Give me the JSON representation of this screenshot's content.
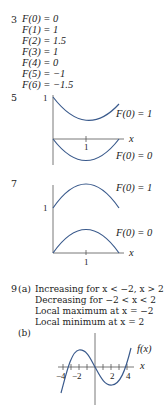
{
  "problem3": {
    "number": "3",
    "values": [
      "F(0) = 0",
      "F(1) = 1",
      "F(2) = 1.5",
      "F(3) = 1",
      "F(4) = 0",
      "F(5) = −1",
      "F(6) = −1.5"
    ]
  },
  "problem5": {
    "number": "5",
    "y_tick": "1",
    "x_tick": "1",
    "x_label": "x",
    "curve_labels": [
      "F(0) = 1",
      "F(0) = 0"
    ]
  },
  "problem7": {
    "number": "7",
    "y_tick": "1",
    "x_tick": "1",
    "x_label": "x",
    "curve_labels": [
      "F(0) = 1",
      "F(0) = 0"
    ]
  },
  "problem9": {
    "number": "9",
    "part_a": {
      "label": "(a)",
      "lines": [
        "Increasing for x < −2, x > 2",
        "Decreasing for −2 < x < 2",
        "Local maximum at x = −2",
        "Local minimum at x = 2"
      ]
    },
    "part_b": {
      "label": "(b)",
      "curve_label": "f(x)",
      "x_label": "x",
      "x_ticks": [
        "−4",
        "−2",
        "2",
        "4"
      ]
    }
  },
  "colors": {
    "curve": "#3a5a8c",
    "axis": "#555555",
    "text": "#222222"
  }
}
